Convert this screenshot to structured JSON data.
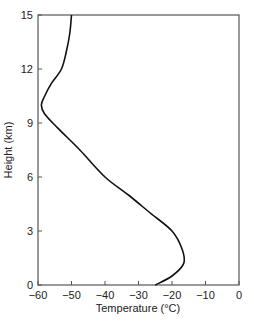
{
  "chart_data": {
    "type": "line",
    "title": "",
    "xlabel": "Temperature (°C)",
    "ylabel": "Height (km)",
    "xlim": [
      -60,
      0
    ],
    "ylim": [
      0,
      15
    ],
    "xticks": [
      -60,
      -50,
      -40,
      -30,
      -20,
      -10,
      0
    ],
    "yticks": [
      0,
      3,
      6,
      9,
      12,
      15
    ],
    "grid": false,
    "legend": null,
    "series": [
      {
        "name": "Temperature profile",
        "x": [
          -25,
          -20,
          -16.5,
          -17,
          -20,
          -26.5,
          -33,
          -40,
          -47.5,
          -54,
          -58,
          -59,
          -58,
          -56,
          -53,
          -51.5,
          -50.5,
          -50
        ],
        "y": [
          0,
          0.5,
          1.2,
          2,
          3,
          4,
          5,
          6,
          7.5,
          8.7,
          9.5,
          10,
          10.5,
          11.2,
          12,
          13,
          14,
          15
        ]
      }
    ]
  }
}
